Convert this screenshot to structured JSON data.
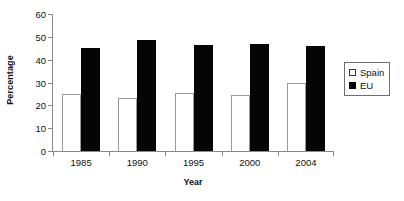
{
  "chart_data": {
    "type": "bar",
    "title": "",
    "xlabel": "Year",
    "ylabel": "Percentage",
    "categories": [
      "1985",
      "1990",
      "1995",
      "2000",
      "2004"
    ],
    "series": [
      {
        "name": "Spain",
        "values": [
          25,
          23,
          25.5,
          24.5,
          30
        ],
        "color": "#ffffff"
      },
      {
        "name": "EU",
        "values": [
          45,
          48.5,
          46.5,
          47,
          46
        ],
        "color": "#050505"
      }
    ],
    "ylim": [
      0,
      60
    ],
    "yticks": [
      0,
      10,
      20,
      30,
      40,
      50,
      60
    ],
    "ytick_labels": [
      "0",
      "10",
      "20",
      "30",
      "40",
      "50",
      "60"
    ],
    "grid": false,
    "legend_position": "right-outside"
  },
  "axes": {
    "y_title": "Percentage",
    "x_title": "Year"
  },
  "legend": {
    "items": [
      {
        "label": "Spain",
        "swatch": "hollow-square-icon"
      },
      {
        "label": "EU",
        "swatch": "filled-square-icon"
      }
    ]
  }
}
